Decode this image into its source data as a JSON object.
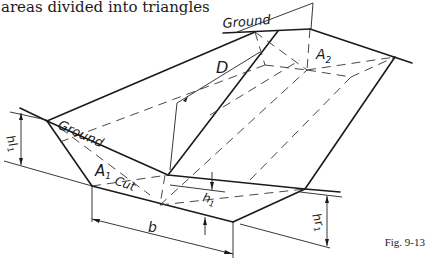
{
  "caption": "areas divided into triangles",
  "figure_label": "Fig. 9-13",
  "labels": {
    "ground_top": "Ground",
    "ground_left": "Ground",
    "D": "D",
    "A2": "A",
    "A2_sub": "2",
    "A1": "A",
    "A1_sub": "1",
    "cut": "Cut",
    "b": "b",
    "hl1": "hl",
    "hl1_sub": "1",
    "hr1": "hr",
    "hr1_sub": "1",
    "h1": "h",
    "h1_sub": "1"
  }
}
